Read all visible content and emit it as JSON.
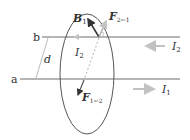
{
  "diagram": {
    "wires": [
      {
        "id": "b",
        "label": "b",
        "current_label": "I",
        "current_sub": "2",
        "current_direction": "left"
      },
      {
        "id": "a",
        "label": "a",
        "current_label": "I",
        "current_sub": "1",
        "current_direction": "right"
      }
    ],
    "separation_label": "d",
    "loop_current_label": "I",
    "loop_current_sub": "2",
    "vectors": {
      "b_field": {
        "label": "B",
        "sub": "1"
      },
      "force_on_2": {
        "label": "F",
        "sub": "2←1"
      },
      "force_on_1": {
        "label": "F",
        "sub": "1←2"
      }
    },
    "colors": {
      "wire": "#b5b5b5",
      "arrow_gray": "#c2c2c2",
      "vector_dark": "#333333",
      "loop": "#555555",
      "dim_line": "#aaaaaa",
      "text": "#333333"
    }
  }
}
